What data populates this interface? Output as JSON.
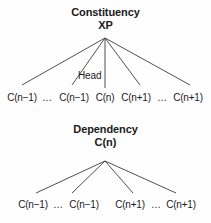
{
  "figure": {
    "background_color": "#fefefe",
    "line_color": "#3c3c3c",
    "text_color": "#1a1a1a"
  },
  "constituency": {
    "title": "Constituency",
    "root_label": "XP",
    "head_label": "Head",
    "root": {
      "x": 105,
      "y": 38
    },
    "children": [
      {
        "label": "C(n−1)",
        "x": 22,
        "y": 90,
        "is_head": false
      },
      {
        "label": "…",
        "x": 47,
        "y": 90,
        "is_head": false
      },
      {
        "label": "C(n−1)",
        "x": 74,
        "y": 90,
        "is_head": false
      },
      {
        "label": "C(n)",
        "x": 105,
        "y": 90,
        "is_head": true
      },
      {
        "label": "C(n+1)",
        "x": 136,
        "y": 90,
        "is_head": false
      },
      {
        "label": "…",
        "x": 162,
        "y": 90,
        "is_head": false
      },
      {
        "label": "C(n+1)",
        "x": 188,
        "y": 90,
        "is_head": false
      }
    ],
    "edges": [
      {
        "x1": 105,
        "y1": 38,
        "x2": 22,
        "y2": 85
      },
      {
        "x1": 105,
        "y1": 38,
        "x2": 72,
        "y2": 85
      },
      {
        "x1": 105,
        "y1": 38,
        "x2": 105,
        "y2": 88
      },
      {
        "x1": 105,
        "y1": 38,
        "x2": 140,
        "y2": 85
      },
      {
        "x1": 105,
        "y1": 38,
        "x2": 190,
        "y2": 85
      }
    ]
  },
  "dependency": {
    "title": "Dependency",
    "root_label": "C(n)",
    "root": {
      "x": 105,
      "y": 161
    },
    "children": [
      {
        "label": "C(n−1)",
        "x": 33,
        "y": 197
      },
      {
        "label": "…",
        "x": 58,
        "y": 197
      },
      {
        "label": "C(n−1)",
        "x": 84,
        "y": 197
      },
      {
        "label": "C(n+1)",
        "x": 130,
        "y": 197
      },
      {
        "label": "…",
        "x": 156,
        "y": 197
      },
      {
        "label": "C(n+1)",
        "x": 181,
        "y": 197
      }
    ],
    "edges": [
      {
        "x1": 105,
        "y1": 161,
        "x2": 36,
        "y2": 193
      },
      {
        "x1": 105,
        "y1": 161,
        "x2": 72,
        "y2": 193
      },
      {
        "x1": 105,
        "y1": 161,
        "x2": 133,
        "y2": 193
      },
      {
        "x1": 105,
        "y1": 161,
        "x2": 176,
        "y2": 193
      }
    ]
  }
}
